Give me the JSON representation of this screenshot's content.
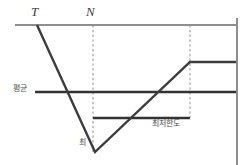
{
  "figure": {
    "background": "#ffffff",
    "width": 249,
    "height": 165
  },
  "labels": {
    "marker_t": "T",
    "marker_n": "N",
    "level_mid": "평균",
    "trough": "최",
    "lower_band": "최저한도"
  },
  "colors": {
    "axis_gray": "#8e8e8e",
    "series_dark": "#3c3c3c",
    "level_dark": "#333333",
    "dash_gray": "#9a9a9a",
    "label_text": "#4a4a4a"
  },
  "chart_data": {
    "type": "line",
    "title": "",
    "xlabel": "",
    "ylabel": "",
    "xlim": [
      0,
      249
    ],
    "ylim": [
      165,
      0
    ],
    "grid": false,
    "legend": null,
    "annotations": [
      {
        "text": "T",
        "x": 35,
        "y": 14,
        "style": "italic-serif"
      },
      {
        "text": "N",
        "x": 93,
        "y": 14,
        "style": "italic-serif"
      },
      {
        "text": "평균",
        "x": 24,
        "y": 92,
        "style": "small-cjk"
      },
      {
        "text": "최",
        "x": 84,
        "y": 146,
        "style": "small-cjk"
      },
      {
        "text": "최저한도",
        "x": 170,
        "y": 126,
        "style": "small-cjk"
      }
    ],
    "vertical_guides": [
      {
        "name": "guide-N",
        "x": 93,
        "y0": 25,
        "y1": 152,
        "dashed": true
      },
      {
        "name": "guide-recovery",
        "x": 190,
        "y0": 25,
        "y1": 118,
        "dashed": true
      }
    ],
    "series": [
      {
        "name": "ceiling-line",
        "kind": "horizontal-segment",
        "color": "#8e8e8e",
        "width": 2,
        "points": [
          [
            15,
            25
          ],
          [
            237,
            25
          ]
        ]
      },
      {
        "name": "mean-level-line",
        "kind": "horizontal-segment",
        "color": "#333333",
        "width": 2.4,
        "points": [
          [
            35,
            92
          ],
          [
            237,
            92
          ]
        ]
      },
      {
        "name": "floor-band-line",
        "kind": "horizontal-segment",
        "color": "#333333",
        "width": 2.4,
        "points": [
          [
            93,
            118
          ],
          [
            190,
            118
          ]
        ]
      },
      {
        "name": "trajectory",
        "kind": "polyline",
        "color": "#3c3c3c",
        "width": 2.4,
        "points": [
          [
            37,
            25
          ],
          [
            95,
            152
          ],
          [
            190,
            62
          ],
          [
            237,
            62
          ]
        ]
      },
      {
        "name": "right-boundary",
        "kind": "vertical-segment",
        "color": "#8e8e8e",
        "width": 2,
        "points": [
          [
            237,
            18
          ],
          [
            237,
            165
          ]
        ]
      }
    ]
  }
}
